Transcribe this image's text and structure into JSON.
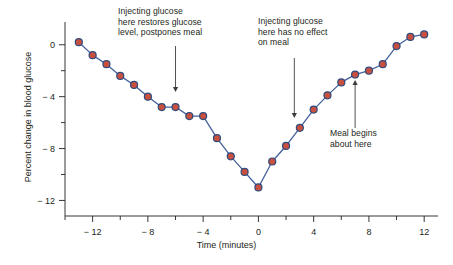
{
  "chart_data": {
    "type": "line",
    "title": "",
    "xlabel": "Time (minutes)",
    "ylabel": "Percent change in blood glucose",
    "xlim": [
      -14,
      13
    ],
    "ylim": [
      -13.2,
      1.6
    ],
    "xticks": [
      -12,
      -8,
      -4,
      0,
      4,
      8,
      12
    ],
    "xticklabels": [
      "− 12",
      "− 8",
      "− 4",
      "0",
      "4",
      "8",
      "12"
    ],
    "xminor_step": 2,
    "yticks": [
      0,
      -4,
      -8,
      -12
    ],
    "yticklabels": [
      "0",
      "− 4",
      "− 8",
      "− 12"
    ],
    "yminor_step": 2,
    "grid": false,
    "legend": "none",
    "marker_face_color": "#c9503f",
    "marker_edge_color": "#2f4a7c",
    "line_color": "#44619c",
    "series": [
      {
        "name": "Blood glucose",
        "x": [
          -13,
          -12,
          -11,
          -10,
          -9,
          -8,
          -7,
          -6,
          -5,
          -4,
          -3,
          -2,
          -1,
          0,
          1,
          2,
          3,
          4,
          5,
          6,
          7,
          8,
          9,
          10,
          11,
          12
        ],
        "y": [
          0.2,
          -0.8,
          -1.5,
          -2.4,
          -3.1,
          -4.0,
          -4.8,
          -4.8,
          -5.5,
          -5.5,
          -7.2,
          -8.6,
          -9.8,
          -11.0,
          -9.0,
          -7.8,
          -6.4,
          -5.0,
          -3.9,
          -2.9,
          -2.3,
          -2.0,
          -1.5,
          -0.1,
          0.6,
          0.8
        ]
      }
    ],
    "annotations": [
      {
        "id": "anno-1",
        "text": "Injecting glucose\nhere restores glucose\nlevel, postpones meal",
        "arrow": "down",
        "arrow_x_min": -6
      },
      {
        "id": "anno-2",
        "text": "Injecting glucose\nhere has no effect\non meal",
        "arrow": "down",
        "arrow_x_min": 2.6
      },
      {
        "id": "anno-3",
        "text": "Meal begins\nabout here",
        "arrow": "up",
        "arrow_x_min": 7
      }
    ]
  }
}
